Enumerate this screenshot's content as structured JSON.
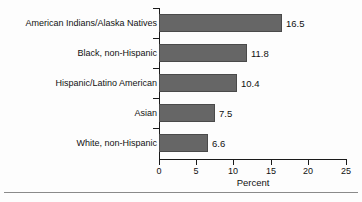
{
  "chart_data": {
    "type": "bar",
    "orientation": "horizontal",
    "title": "",
    "xlabel": "Percent",
    "ylabel": "",
    "xlim": [
      0,
      25
    ],
    "xticks": [
      0,
      5,
      10,
      15,
      20,
      25
    ],
    "xtick_labels": [
      "0",
      "5",
      "10",
      "15",
      "20",
      "25"
    ],
    "grid": false,
    "legend": false,
    "categories": [
      "American Indians/Alaska Natives",
      "Black, non-Hispanic",
      "Hispanic/Latino American",
      "Asian",
      "White, non-Hispanic"
    ],
    "values": [
      16.5,
      11.8,
      10.4,
      7.5,
      6.6
    ],
    "value_labels": [
      "16.5",
      "11.8",
      "10.4",
      "7.5",
      "6.6"
    ],
    "bar_color": "#666666",
    "bar_edge_color": "#4a4a4a",
    "axis_color": "#1a1a1a",
    "background_color": "#fdfdfd"
  }
}
